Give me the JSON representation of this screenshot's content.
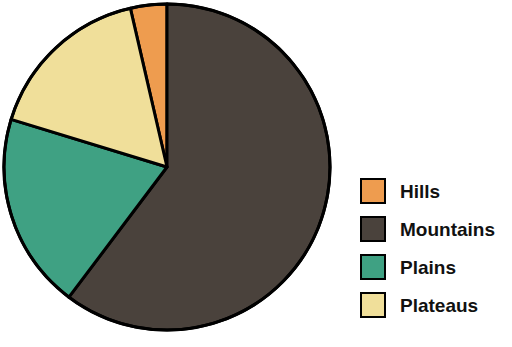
{
  "background_color": "#ffffff",
  "chart_data": {
    "type": "pie",
    "title": "",
    "subtitle": "",
    "xlabel": "",
    "ylabel": "",
    "grid": false,
    "legend_position": "right",
    "start_angle_deg": -13,
    "direction": "clockwise",
    "center": {
      "x": 167,
      "y": 167
    },
    "radius": 163,
    "outline_color": "#000000",
    "outline_width": 3,
    "categories": [
      "Hills",
      "Mountains",
      "Plains",
      "Plateaus"
    ],
    "values": [
      3.6,
      60.3,
      19.4,
      16.7
    ],
    "value_unit": "percent",
    "angles_deg": [
      13,
      217,
      70,
      60
    ],
    "colors": [
      "#ee9c4f",
      "#4a423c",
      "#3fa183",
      "#f0df9a"
    ],
    "slices": [
      {
        "label": "Hills",
        "value": 3.6,
        "angle_deg": 13,
        "color": "#ee9c4f"
      },
      {
        "label": "Mountains",
        "value": 60.3,
        "angle_deg": 217,
        "color": "#4a423c"
      },
      {
        "label": "Plains",
        "value": 19.4,
        "angle_deg": 70,
        "color": "#3fa183"
      },
      {
        "label": "Plateaus",
        "value": 16.7,
        "angle_deg": 60,
        "color": "#f0df9a"
      }
    ]
  },
  "legend": {
    "items": [
      {
        "label": "Hills",
        "color": "#ee9c4f"
      },
      {
        "label": "Mountains",
        "color": "#4a423c"
      },
      {
        "label": "Plains",
        "color": "#3fa183"
      },
      {
        "label": "Plateaus",
        "color": "#f0df9a"
      }
    ]
  }
}
